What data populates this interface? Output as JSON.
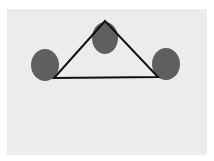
{
  "diagram": {
    "width": 214,
    "height": 161,
    "background_color": "#ffffff",
    "panel": {
      "x": 7,
      "y": 9,
      "width": 200,
      "height": 146,
      "color": "#ececec"
    },
    "node_color": "#5f5f5f",
    "edge_color": "#111111",
    "edge_width": 2,
    "nodes": [
      {
        "id": "top",
        "cx": 105,
        "cy": 38,
        "rx": 13,
        "ry": 16
      },
      {
        "id": "left",
        "cx": 45,
        "cy": 65,
        "rx": 14,
        "ry": 16
      },
      {
        "id": "right",
        "cx": 166,
        "cy": 64,
        "rx": 14,
        "ry": 16
      }
    ],
    "triangle": {
      "points": [
        [
          105,
          21
        ],
        [
          54,
          78
        ],
        [
          158,
          77
        ]
      ]
    }
  }
}
